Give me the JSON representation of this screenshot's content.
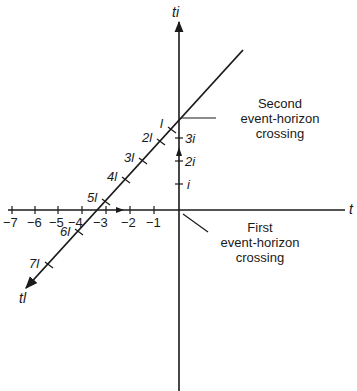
{
  "diagram": {
    "axes": {
      "horizontal_label": "t",
      "vertical_label": "ti",
      "diagonal_label": "tl"
    },
    "horizontal_ticks": [
      "−7",
      "−6",
      "−5",
      "−4",
      "−3",
      "−2",
      "−1"
    ],
    "vertical_ticks": [
      "i",
      "2i",
      "3i"
    ],
    "diagonal_ticks": [
      "l",
      "2l",
      "3l",
      "4l",
      "5l",
      "6l",
      "7l"
    ],
    "annotations": {
      "second_crossing": [
        "Second",
        "event-horizon",
        "crossing"
      ],
      "first_crossing": [
        "First",
        "event-horizon",
        "crossing"
      ]
    },
    "colors": {
      "line": "#1a1a1a",
      "background": "#ffffff"
    }
  }
}
